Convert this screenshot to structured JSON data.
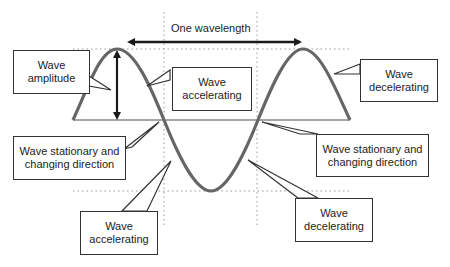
{
  "diagram": {
    "wavelength_label": "One wavelength",
    "colors": {
      "wave": "#666666",
      "arrow": "#1a1a1a",
      "grid": "#999999",
      "box_border": "#333333"
    },
    "callouts": {
      "amplitude": "Wave\namplitude",
      "accelerating_top": "Wave\naccelerating",
      "decelerating_top": "Wave\ndecelerating",
      "stationary_left": "Wave stationary and\nchanging direction",
      "stationary_right": "Wave stationary and\nchanging direction",
      "accelerating_bottom": "Wave\naccelerating",
      "decelerating_bottom": "Wave\ndecelerating"
    }
  }
}
